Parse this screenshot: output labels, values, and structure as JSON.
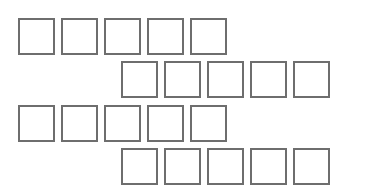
{
  "diagram": {
    "border_color": "#6e6e6e",
    "background": "#ffffff",
    "box_size": 37,
    "box_pitch": 43,
    "rows": [
      {
        "name": "row-1",
        "x": 18,
        "y": 18,
        "count": 5
      },
      {
        "name": "row-2",
        "x": 121,
        "y": 61,
        "count": 5
      },
      {
        "name": "row-3",
        "x": 18,
        "y": 105,
        "count": 5
      },
      {
        "name": "row-4",
        "x": 121,
        "y": 148,
        "count": 5
      }
    ]
  }
}
